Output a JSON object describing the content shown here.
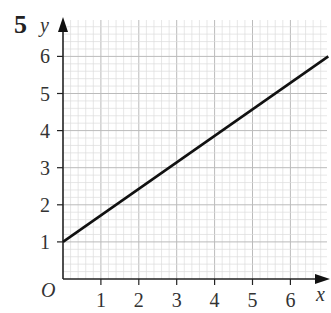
{
  "question_number": "5",
  "chart_data": {
    "type": "line",
    "title": "",
    "xlabel": "x",
    "ylabel": "y",
    "origin_label": "O",
    "xlim": [
      0,
      7
    ],
    "ylim": [
      0,
      6.6
    ],
    "x_ticks": [
      1,
      2,
      3,
      4,
      5,
      6
    ],
    "y_ticks": [
      1,
      2,
      3,
      4,
      5,
      6
    ],
    "grid": true,
    "minor_subdivisions": 5,
    "series": [
      {
        "name": "line",
        "x": [
          0,
          7
        ],
        "y": [
          1,
          6
        ],
        "color": "#111111"
      }
    ]
  }
}
